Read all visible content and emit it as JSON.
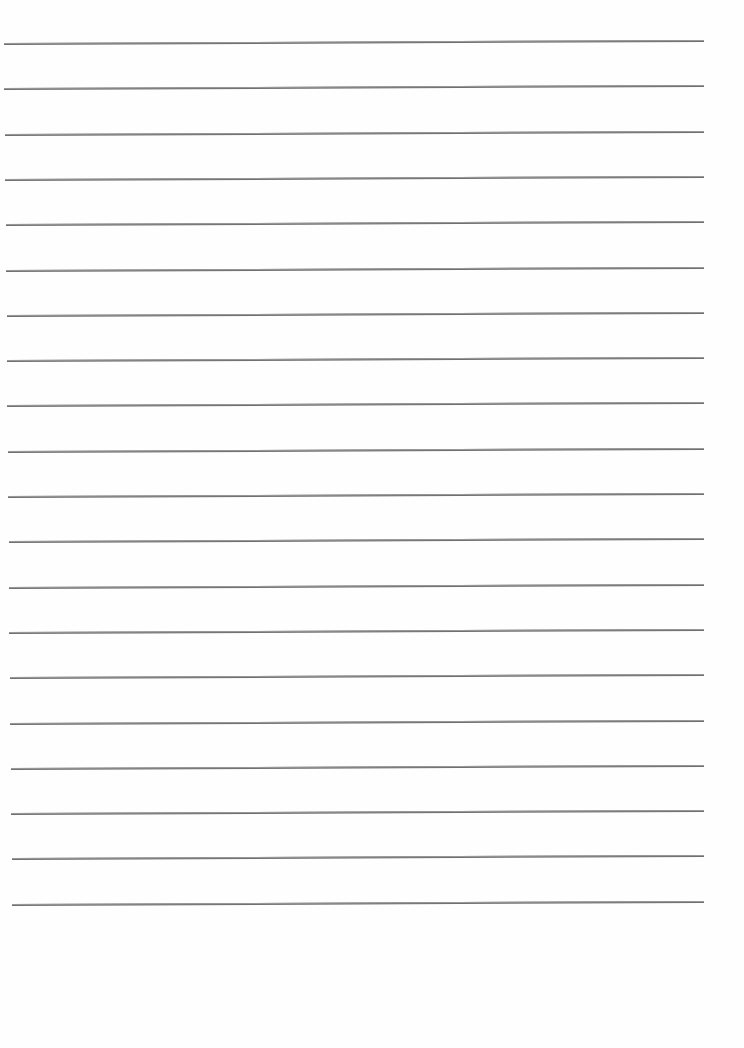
{
  "document": {
    "type": "lined-paper",
    "text": "",
    "line_count": 20,
    "line_color": "#6f6f6f",
    "paper_color": "#fefefe",
    "first_line_y": 43,
    "line_spacing": 45.3,
    "left_start_top": 4,
    "left_start_bottom": 12,
    "right_end": 704,
    "skew_deg": -0.25
  }
}
